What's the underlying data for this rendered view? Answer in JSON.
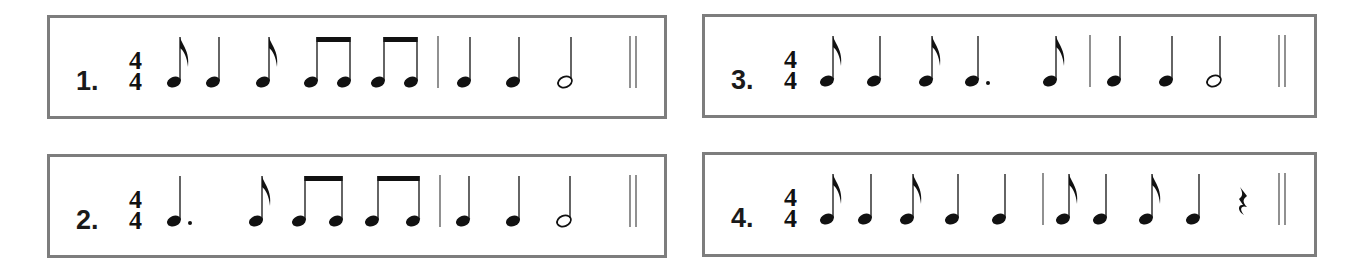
{
  "exercises": [
    {
      "number": "1.",
      "time_signature": {
        "top": "4",
        "bottom": "4"
      },
      "box": {
        "x": 47,
        "y": 15,
        "w": 620,
        "h": 104
      },
      "elements": [
        {
          "type": "eighth",
          "x": 180
        },
        {
          "type": "quarter",
          "x": 219
        },
        {
          "type": "eighth",
          "x": 269
        },
        {
          "type": "beamed-eighths",
          "x": 317,
          "x2": 350
        },
        {
          "type": "beamed-eighths",
          "x": 384,
          "x2": 417
        },
        {
          "type": "barline",
          "x": 438
        },
        {
          "type": "quarter",
          "x": 470
        },
        {
          "type": "quarter",
          "x": 519
        },
        {
          "type": "half",
          "x": 571
        },
        {
          "type": "double-barline",
          "x": 630
        }
      ]
    },
    {
      "number": "2.",
      "time_signature": {
        "top": "4",
        "bottom": "4"
      },
      "box": {
        "x": 47,
        "y": 154,
        "w": 620,
        "h": 104
      },
      "elements": [
        {
          "type": "dotted-quarter",
          "x": 180
        },
        {
          "type": "eighth",
          "x": 262
        },
        {
          "type": "beamed-eighths",
          "x": 305,
          "x2": 342
        },
        {
          "type": "beamed-eighths",
          "x": 378,
          "x2": 419
        },
        {
          "type": "barline",
          "x": 440
        },
        {
          "type": "quarter",
          "x": 469
        },
        {
          "type": "quarter",
          "x": 519
        },
        {
          "type": "half",
          "x": 570
        },
        {
          "type": "double-barline",
          "x": 630
        }
      ]
    },
    {
      "number": "3.",
      "time_signature": {
        "top": "4",
        "bottom": "4"
      },
      "box": {
        "x": 702,
        "y": 14,
        "w": 615,
        "h": 104
      },
      "elements": [
        {
          "type": "eighth",
          "x": 833
        },
        {
          "type": "quarter",
          "x": 880
        },
        {
          "type": "eighth",
          "x": 932
        },
        {
          "type": "dotted-quarter",
          "x": 978
        },
        {
          "type": "eighth",
          "x": 1056
        },
        {
          "type": "barline",
          "x": 1090
        },
        {
          "type": "quarter",
          "x": 1120
        },
        {
          "type": "quarter",
          "x": 1172
        },
        {
          "type": "half",
          "x": 1220
        },
        {
          "type": "double-barline",
          "x": 1279
        }
      ]
    },
    {
      "number": "4.",
      "time_signature": {
        "top": "4",
        "bottom": "4"
      },
      "box": {
        "x": 702,
        "y": 152,
        "w": 615,
        "h": 105
      },
      "elements": [
        {
          "type": "eighth",
          "x": 833
        },
        {
          "type": "quarter",
          "x": 871
        },
        {
          "type": "eighth",
          "x": 913
        },
        {
          "type": "quarter",
          "x": 958
        },
        {
          "type": "quarter",
          "x": 1005
        },
        {
          "type": "barline",
          "x": 1043
        },
        {
          "type": "eighth",
          "x": 1069
        },
        {
          "type": "quarter",
          "x": 1106
        },
        {
          "type": "eighth",
          "x": 1152
        },
        {
          "type": "quarter",
          "x": 1199
        },
        {
          "type": "quarter-rest",
          "x": 1243
        },
        {
          "type": "double-barline",
          "x": 1279
        }
      ]
    }
  ],
  "colors": {
    "border": "#7d7d7d",
    "ink": "#111111",
    "background": "#ffffff"
  }
}
